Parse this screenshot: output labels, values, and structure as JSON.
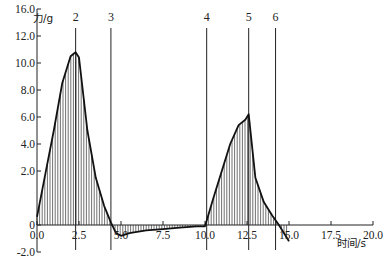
{
  "chart_data": {
    "type": "area",
    "title": "",
    "xlabel": "时间/s",
    "ylabel": "力/g",
    "xlim": [
      0,
      20
    ],
    "ylim": [
      -2,
      16
    ],
    "x_ticks": [
      "0.0",
      "2.5",
      "5.0",
      "7.5",
      "10.0",
      "12.5",
      "15.0",
      "17.5",
      "20.0"
    ],
    "y_ticks": [
      {
        "label": "16.0",
        "value": 16
      },
      {
        "label": "12.0",
        "value": 14
      },
      {
        "label": "10.0",
        "value": 12
      },
      {
        "label": "8.0",
        "value": 10
      },
      {
        "label": "6.0",
        "value": 8
      },
      {
        "label": "4.0",
        "value": 6
      },
      {
        "label": "2.0",
        "value": 4
      },
      {
        "label": "0",
        "value": 0
      },
      {
        "label": "-2.0",
        "value": -2
      }
    ],
    "y_tick_note": "Tick labels as printed in the figure (2.0 is drawn at the 2.0 gridline position)",
    "markers": [
      {
        "label": "2",
        "x": 2.3
      },
      {
        "label": "3",
        "x": 4.4
      },
      {
        "label": "4",
        "x": 10.1
      },
      {
        "label": "5",
        "x": 12.6
      },
      {
        "label": "6",
        "x": 14.2
      }
    ],
    "series": [
      {
        "name": "力",
        "x": [
          0.0,
          0.5,
          1.0,
          1.5,
          2.0,
          2.3,
          2.5,
          3.0,
          3.5,
          4.0,
          4.4,
          4.7,
          5.0,
          5.5,
          6.5,
          7.5,
          8.5,
          9.5,
          10.0,
          10.5,
          11.0,
          11.5,
          12.0,
          12.4,
          12.6,
          13.0,
          13.5,
          14.0,
          14.4,
          15.0
        ],
        "values": [
          0.6,
          3.8,
          7.0,
          10.5,
          12.5,
          12.8,
          12.4,
          7.0,
          3.5,
          1.4,
          0.2,
          -0.6,
          -0.8,
          -0.6,
          -0.4,
          -0.3,
          -0.2,
          -0.1,
          -0.1,
          2.0,
          4.0,
          6.0,
          7.4,
          7.8,
          8.2,
          3.5,
          1.7,
          0.7,
          0.0,
          -1.2
        ]
      }
    ],
    "grid": false,
    "legend": null
  }
}
